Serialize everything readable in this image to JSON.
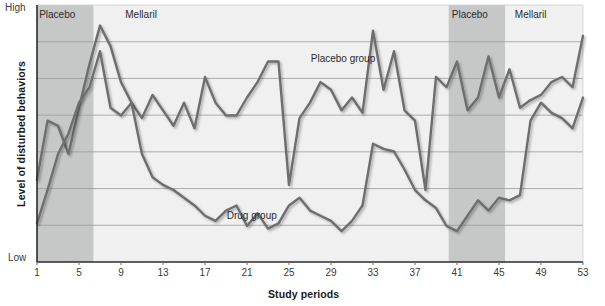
{
  "chart_data": {
    "type": "line",
    "title": "",
    "xlabel": "Study periods",
    "ylabel": "Level of disturbed behaviors",
    "y_axis_top_label": "High",
    "y_axis_bottom_label": "Low",
    "ylim": [
      0,
      100
    ],
    "xlim": [
      1,
      53
    ],
    "grid": true,
    "gridline_count": 6,
    "legend_position": "inline-annotations",
    "xticks": [
      1,
      5,
      9,
      13,
      17,
      21,
      25,
      29,
      33,
      37,
      41,
      45,
      49,
      53
    ],
    "xtick_labels": [
      "1",
      "5",
      "9",
      "13",
      "17",
      "21",
      "25",
      "29",
      "33",
      "37",
      "41",
      "45",
      "49",
      "53"
    ],
    "shaded_bands": [
      {
        "label": "Placebo",
        "start": 1,
        "end": 6.4,
        "color": "#c6c7c7"
      },
      {
        "label": "Mellaril",
        "start": 6.4,
        "end": 40.2,
        "color": "#f0f0f0"
      },
      {
        "label": "Placebo",
        "start": 40.2,
        "end": 45.6,
        "color": "#c6c7c7"
      },
      {
        "label": "Mellaril",
        "start": 45.6,
        "end": 53,
        "color": "#f0f0f0"
      }
    ],
    "band_labels": [
      {
        "text": "Placebo",
        "x": 3.3
      },
      {
        "text": "Mellaril",
        "x": 11.5
      },
      {
        "text": "Placebo",
        "x": 42.6
      },
      {
        "text": "Mellaril",
        "x": 48.6
      }
    ],
    "series": [
      {
        "name": "Placebo group",
        "color": "#6e6e6e",
        "label_x": 30.5,
        "label_y": 78.5,
        "x": [
          1,
          2,
          3,
          4,
          5,
          6,
          7,
          8,
          9,
          10,
          11,
          12,
          13,
          14,
          15,
          16,
          17,
          18,
          19,
          20,
          21,
          22,
          23,
          24,
          25,
          26,
          27,
          28,
          29,
          30,
          31,
          32,
          33,
          34,
          35,
          36,
          37,
          38,
          39,
          40,
          41,
          42,
          43,
          44,
          45,
          46,
          47,
          48,
          49,
          50,
          51,
          52,
          53
        ],
        "values": [
          32,
          55,
          53,
          42,
          60,
          77,
          92,
          84,
          70,
          62,
          56,
          65,
          59,
          53,
          62,
          52,
          72,
          62,
          57,
          57,
          64,
          70,
          78,
          78,
          30,
          56,
          62,
          70,
          67,
          59,
          64,
          58,
          90,
          67,
          82,
          59,
          55,
          28,
          72,
          68,
          78,
          59,
          64,
          80,
          64,
          75,
          60,
          63,
          65,
          70,
          72,
          68,
          88
        ]
      },
      {
        "name": "Drug group",
        "color": "#6e6e6e",
        "label_x": 22.5,
        "label_y": 17.5,
        "x": [
          1,
          2,
          3,
          4,
          5,
          6,
          7,
          8,
          9,
          10,
          11,
          12,
          13,
          14,
          15,
          16,
          17,
          18,
          19,
          20,
          21,
          22,
          23,
          24,
          25,
          26,
          27,
          28,
          29,
          30,
          31,
          32,
          33,
          34,
          35,
          36,
          37,
          38,
          39,
          40,
          41,
          42,
          43,
          44,
          45,
          46,
          47,
          48,
          49,
          50,
          51,
          52,
          53
        ],
        "values": [
          15,
          28,
          42,
          50,
          62,
          68,
          82,
          60,
          57,
          62,
          42,
          33,
          30,
          28,
          25,
          22,
          18,
          16,
          20,
          22,
          14,
          19,
          13,
          15,
          22,
          25,
          20,
          18,
          16,
          12,
          16,
          22,
          46,
          44,
          43,
          36,
          28,
          24,
          21,
          14,
          12,
          18,
          24,
          20,
          25,
          24,
          26,
          55,
          62,
          58,
          56,
          52,
          64
        ]
      }
    ],
    "annotations": [
      {
        "text": "Placebo group"
      },
      {
        "text": "Drug group"
      }
    ]
  },
  "axis": {
    "y_high": "High",
    "y_low": "Low",
    "y_title": "Level of disturbed behaviors",
    "x_title": "Study periods"
  }
}
